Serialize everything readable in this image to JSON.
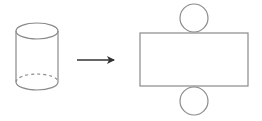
{
  "diagram": {
    "stroke_color": "#8a8a8a",
    "arrow_color": "#333333",
    "background": "#ffffff",
    "cylinder": {
      "label": "cylinder",
      "cx": 37,
      "rx": 21,
      "top_cy": 31,
      "bottom_cy": 82,
      "ry": 8
    },
    "arrow": {
      "label": "transforms-to",
      "x1": 77,
      "x2": 114,
      "y": 60
    },
    "net": {
      "rectangle": {
        "label": "lateral-surface",
        "x": 140,
        "y": 33,
        "width": 108,
        "height": 53
      },
      "top_circle": {
        "label": "top-base",
        "cx": 194,
        "cy": 18,
        "r": 14
      },
      "bottom_circle": {
        "label": "bottom-base",
        "cx": 194,
        "cy": 101,
        "r": 14
      }
    }
  }
}
